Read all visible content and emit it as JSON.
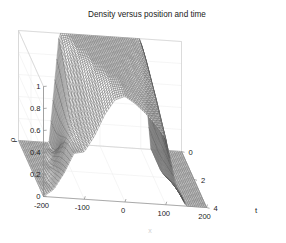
{
  "figure": {
    "title": "Density versus position and time",
    "background_color": "#ffffff",
    "mesh_color": "#4a4a4a",
    "axis_color": "#8a8a8a",
    "box_color": "#c9c9c9"
  },
  "axes": {
    "x": {
      "label": "x",
      "ticks": [
        "-200",
        "-100",
        "0",
        "100",
        "200"
      ],
      "tick_values": [
        -200,
        -100,
        0,
        100,
        200
      ],
      "range": [
        -200,
        200
      ]
    },
    "y": {
      "label": "ρ",
      "ticks": [
        "0",
        "0.2",
        "0.4",
        "0.6",
        "0.8",
        "1"
      ],
      "tick_values": [
        0,
        0.2,
        0.4,
        0.6,
        0.8,
        1
      ],
      "range": [
        0,
        1
      ]
    },
    "t": {
      "label": "t",
      "ticks": [
        "0",
        "2",
        "4"
      ],
      "tick_values": [
        0,
        2,
        4
      ],
      "range": [
        0,
        4
      ]
    }
  },
  "chart_data": {
    "type": "line",
    "plot_style": "mesh3d",
    "title": "Density versus position and time",
    "xlabel": "x",
    "ylabel": "ρ",
    "zlabel": "t",
    "xlim": [
      -200,
      200
    ],
    "ylim": [
      0,
      1
    ],
    "tlim": [
      0,
      4
    ],
    "grid": true,
    "legend": null,
    "x": [
      -200,
      -175,
      -150,
      -125,
      -100,
      -75,
      -50,
      -25,
      0,
      25,
      50,
      75,
      100,
      125,
      150,
      175,
      200
    ],
    "t": [
      0,
      0.5,
      1,
      1.5,
      2,
      2.5,
      3,
      3.5,
      4
    ],
    "series": [
      {
        "name": "t=0",
        "t": 0,
        "values": [
          0,
          0,
          0,
          0,
          1.0,
          1.0,
          1.0,
          1.0,
          1.0,
          1.0,
          1.0,
          1.0,
          1.0,
          0,
          0,
          0,
          0
        ]
      },
      {
        "name": "t=0.5",
        "t": 0.5,
        "values": [
          0,
          0,
          0,
          0,
          0.93,
          1.0,
          1.0,
          1.0,
          1.0,
          1.0,
          1.0,
          1.0,
          0.97,
          0,
          0,
          0,
          0
        ]
      },
      {
        "name": "t=1",
        "t": 1,
        "values": [
          0,
          0,
          0,
          0.05,
          0.82,
          1.0,
          1.0,
          1.0,
          1.0,
          1.0,
          1.0,
          0.99,
          0.93,
          0,
          0,
          0,
          0
        ]
      },
      {
        "name": "t=1.5",
        "t": 1.5,
        "values": [
          0,
          0,
          0,
          0.14,
          0.7,
          0.97,
          1.0,
          1.0,
          1.0,
          1.0,
          1.0,
          0.96,
          0.88,
          0,
          0,
          0,
          0
        ]
      },
      {
        "name": "t=2",
        "t": 2,
        "values": [
          0,
          0,
          0.03,
          0.24,
          0.58,
          0.9,
          1.0,
          1.0,
          1.0,
          1.0,
          0.98,
          0.92,
          0.83,
          0.02,
          0,
          0,
          0
        ]
      },
      {
        "name": "t=2.5",
        "t": 2.5,
        "values": [
          0,
          0,
          0.08,
          0.32,
          0.5,
          0.8,
          0.98,
          1.0,
          1.0,
          0.99,
          0.95,
          0.87,
          0.78,
          0.06,
          0,
          0,
          0
        ]
      },
      {
        "name": "t=3",
        "t": 3,
        "values": [
          0,
          0.01,
          0.13,
          0.37,
          0.46,
          0.71,
          0.92,
          1.0,
          1.0,
          0.97,
          0.91,
          0.82,
          0.72,
          0.1,
          0,
          0,
          0
        ]
      },
      {
        "name": "t=3.5",
        "t": 3.5,
        "values": [
          0,
          0.04,
          0.18,
          0.39,
          0.44,
          0.64,
          0.85,
          0.97,
          0.99,
          0.94,
          0.87,
          0.77,
          0.66,
          0.14,
          0,
          0,
          0
        ]
      },
      {
        "name": "t=4",
        "t": 4,
        "values": [
          0,
          0.07,
          0.22,
          0.41,
          0.43,
          0.58,
          0.78,
          0.92,
          0.96,
          0.9,
          0.82,
          0.72,
          0.6,
          0.18,
          0,
          0,
          0
        ]
      }
    ]
  }
}
